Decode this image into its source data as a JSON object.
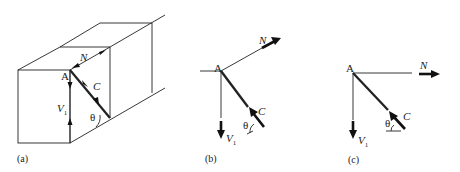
{
  "figure": {
    "panels": [
      {
        "id": "a",
        "caption": "(a)",
        "description": "3D beam element with diagonal strut at point A",
        "labels": {
          "point": "A",
          "normal_force": "N",
          "strut_force": "C",
          "shear_force_main": "V",
          "shear_force_sub": "1",
          "angle": "θ"
        }
      },
      {
        "id": "b",
        "caption": "(b)",
        "description": "Free-body diagram at A with inclined N",
        "labels": {
          "point": "A",
          "normal_force": "N",
          "strut_force": "C",
          "shear_force_main": "V",
          "shear_force_sub": "1",
          "angle": "θ"
        }
      },
      {
        "id": "c",
        "caption": "(c)",
        "description": "Free-body diagram at A with horizontal N",
        "labels": {
          "point": "A",
          "normal_force": "N",
          "strut_force": "C",
          "shear_force_main": "V",
          "shear_force_sub": "1",
          "angle": "θ"
        }
      }
    ],
    "colors": {
      "line": "#222222",
      "background": "#ffffff"
    }
  }
}
